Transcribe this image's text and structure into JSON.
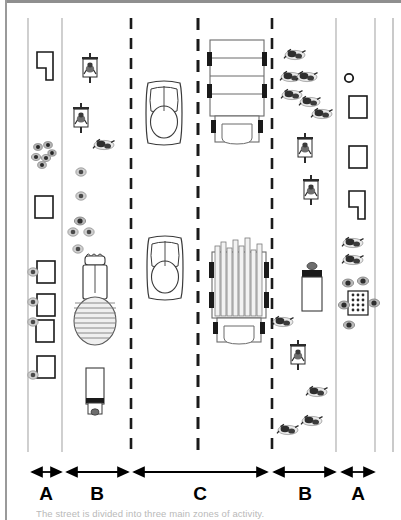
{
  "figure": {
    "caption": "The street is divided into three main zones of activity.",
    "frame": {
      "border_color": "#9a9a9a",
      "background": "#ffffff"
    },
    "zone_labels": [
      "A",
      "B",
      "C",
      "B",
      "A"
    ],
    "zone_ranges": [
      {
        "label": "A",
        "x_start": 31,
        "x_end": 62
      },
      {
        "label": "B",
        "x_start": 66,
        "x_end": 129
      },
      {
        "label": "C",
        "x_start": 133,
        "x_end": 268
      },
      {
        "label": "B",
        "x_start": 272,
        "x_end": 336
      },
      {
        "label": "A",
        "x_start": 341,
        "x_end": 375
      }
    ],
    "lane_lines": {
      "solid_color": "#b9b9b9",
      "dashed_color": "#1a1a1a",
      "solid_x": [
        28,
        62,
        336,
        375,
        392
      ],
      "dashed_x": [
        131,
        198,
        272
      ]
    },
    "arrow_color": "#000000",
    "label_color": "#000000"
  },
  "legend_items": [
    {
      "name": "motorcycle",
      "count": 14
    },
    {
      "name": "pedestrian",
      "count": 26
    },
    {
      "name": "car",
      "count": 2
    },
    {
      "name": "truck",
      "count": 3
    },
    {
      "name": "handcart",
      "count": 4
    },
    {
      "name": "stall",
      "count": 8
    },
    {
      "name": "vendor-table",
      "count": 1
    }
  ]
}
